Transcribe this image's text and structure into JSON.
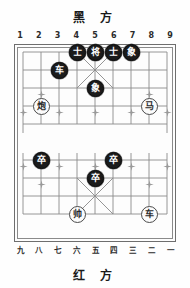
{
  "titles": {
    "black_side": "黑 方",
    "red_side": "红 方"
  },
  "coordinates": {
    "top": [
      "1",
      "2",
      "3",
      "4",
      "5",
      "6",
      "7",
      "8",
      "9"
    ],
    "bottom": [
      "九",
      "八",
      "七",
      "六",
      "五",
      "四",
      "三",
      "二",
      "一"
    ]
  },
  "board": {
    "files": 9,
    "ranks": 10,
    "colors": {
      "black_piece_fill": "#1b1b1b",
      "black_piece_text": "#ffffff",
      "red_piece_fill": "#fbfbfb",
      "red_piece_text": "#2a2a2a",
      "grid_line": "#8a8a8a",
      "frame": "#6e6e6e",
      "background": "#fdfdfd"
    },
    "pieces": [
      {
        "id": "p1",
        "name": "black-advisor-left",
        "label": "士",
        "side": "black",
        "file": 4,
        "rank": 0
      },
      {
        "id": "p2",
        "name": "black-general",
        "label": "将",
        "side": "black",
        "file": 5,
        "rank": 0
      },
      {
        "id": "p3",
        "name": "black-advisor-right",
        "label": "士",
        "side": "black",
        "file": 6,
        "rank": 0
      },
      {
        "id": "p4",
        "name": "black-elephant-right",
        "label": "象",
        "side": "black",
        "file": 7,
        "rank": 0
      },
      {
        "id": "p5",
        "name": "black-chariot",
        "label": "车",
        "side": "black",
        "file": 3,
        "rank": 1
      },
      {
        "id": "p6",
        "name": "black-elephant-left",
        "label": "象",
        "side": "black",
        "file": 5,
        "rank": 2
      },
      {
        "id": "p7",
        "name": "red-cannon",
        "label": "炮",
        "side": "red",
        "file": 2,
        "rank": 3
      },
      {
        "id": "p8",
        "name": "red-horse",
        "label": "马",
        "side": "red",
        "file": 8,
        "rank": 3
      },
      {
        "id": "p9",
        "name": "black-pawn-left",
        "label": "卒",
        "side": "black",
        "file": 2,
        "rank": 6
      },
      {
        "id": "p10",
        "name": "black-pawn-right",
        "label": "卒",
        "side": "black",
        "file": 6,
        "rank": 6
      },
      {
        "id": "p11",
        "name": "black-pawn-center",
        "label": "卒",
        "side": "black",
        "file": 5,
        "rank": 7
      },
      {
        "id": "p12",
        "name": "red-marshal",
        "label": "帅",
        "side": "red",
        "file": 4,
        "rank": 9
      },
      {
        "id": "p13",
        "name": "red-chariot",
        "label": "车",
        "side": "red",
        "file": 8,
        "rank": 9
      }
    ],
    "star_points": [
      {
        "file": 2,
        "rank": 2
      },
      {
        "file": 8,
        "rank": 2
      },
      {
        "file": 1,
        "rank": 3
      },
      {
        "file": 3,
        "rank": 3
      },
      {
        "file": 5,
        "rank": 3
      },
      {
        "file": 7,
        "rank": 3
      },
      {
        "file": 9,
        "rank": 3
      },
      {
        "file": 1,
        "rank": 6
      },
      {
        "file": 3,
        "rank": 6
      },
      {
        "file": 5,
        "rank": 6
      },
      {
        "file": 7,
        "rank": 6
      },
      {
        "file": 9,
        "rank": 6
      },
      {
        "file": 2,
        "rank": 7
      },
      {
        "file": 8,
        "rank": 7
      }
    ]
  }
}
